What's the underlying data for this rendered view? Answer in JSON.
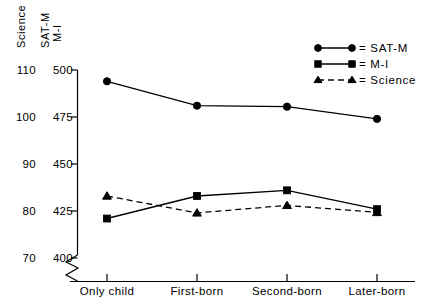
{
  "chart_data": {
    "type": "line",
    "title": "",
    "xlabel": "",
    "categories": [
      "Only child",
      "First-born",
      "Second-born",
      "Later-born"
    ],
    "grid": false,
    "legend_position": "top-right",
    "axes": {
      "left": {
        "label": "Science",
        "ticks": [
          "70",
          "80",
          "90",
          "100",
          "110"
        ],
        "ylim": [
          70,
          110
        ]
      },
      "right_scale": {
        "label_line1": "SAT-M",
        "label_line2": "M-I",
        "ticks": [
          "400",
          "425",
          "450",
          "475",
          "500"
        ],
        "ylim": [
          400,
          500
        ]
      },
      "break_symbol": true
    },
    "series": [
      {
        "name": "SAT-M",
        "scale": "sat",
        "marker": "circle",
        "dash": false,
        "values": [
          494,
          481,
          480.5,
          474
        ]
      },
      {
        "name": "M-I",
        "scale": "sat",
        "marker": "square",
        "dash": false,
        "values": [
          421,
          433,
          436,
          426
        ]
      },
      {
        "name": "Science",
        "scale": "science",
        "marker": "triangle",
        "dash": true,
        "values": [
          83.2,
          79.6,
          81.2,
          79.7
        ]
      }
    ]
  },
  "legend": {
    "entries": [
      {
        "label": "= SAT-M",
        "marker": "circle",
        "dash": false
      },
      {
        "label": "= M-I",
        "marker": "square",
        "dash": false
      },
      {
        "label": "= Science",
        "marker": "triangle",
        "dash": true
      }
    ]
  },
  "axis_titles": {
    "science": "Science",
    "sat_m": "SAT-M",
    "m_i": "M-I"
  },
  "colors": {
    "ink": "#000000",
    "background": "#ffffff"
  }
}
